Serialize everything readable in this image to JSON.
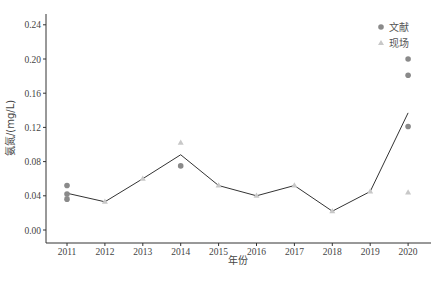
{
  "chart_data": {
    "type": "line",
    "title": "",
    "xlabel": "年份",
    "ylabel": "氨氮/(mg/L)",
    "categories": [
      "2011",
      "2012",
      "2013",
      "2014",
      "2015",
      "2016",
      "2017",
      "2018",
      "2019",
      "2020"
    ],
    "yticks": [
      "0.00",
      "0.04",
      "0.08",
      "0.12",
      "0.16",
      "0.20",
      "0.24"
    ],
    "ylim": [
      -0.015,
      0.255
    ],
    "grid": false,
    "legend_position": "top-right",
    "series": [
      {
        "name": "mean",
        "type": "line",
        "color": "#333333",
        "values": [
          0.043,
          0.033,
          0.06,
          0.088,
          0.052,
          0.04,
          0.052,
          0.022,
          0.045,
          0.137
        ]
      },
      {
        "name": "文献",
        "type": "scatter",
        "marker": "circle",
        "color": "#8a8a8a",
        "points": [
          {
            "x": "2011",
            "y": 0.052
          },
          {
            "x": "2011",
            "y": 0.042
          },
          {
            "x": "2011",
            "y": 0.036
          },
          {
            "x": "2014",
            "y": 0.075
          },
          {
            "x": "2020",
            "y": 0.2
          },
          {
            "x": "2020",
            "y": 0.181
          },
          {
            "x": "2020",
            "y": 0.121
          }
        ]
      },
      {
        "name": "现场",
        "type": "scatter",
        "marker": "triangle",
        "color": "#c8c8c8",
        "points": [
          {
            "x": "2011",
            "y": 0.04
          },
          {
            "x": "2012",
            "y": 0.033
          },
          {
            "x": "2013",
            "y": 0.06
          },
          {
            "x": "2014",
            "y": 0.102
          },
          {
            "x": "2015",
            "y": 0.052
          },
          {
            "x": "2016",
            "y": 0.04
          },
          {
            "x": "2017",
            "y": 0.052
          },
          {
            "x": "2018",
            "y": 0.022
          },
          {
            "x": "2019",
            "y": 0.045
          },
          {
            "x": "2020",
            "y": 0.044
          }
        ]
      }
    ]
  },
  "legend": {
    "items": [
      {
        "label": "文献",
        "marker": "circle",
        "color": "#8a8a8a"
      },
      {
        "label": "现场",
        "marker": "triangle",
        "color": "#c8c8c8"
      }
    ]
  }
}
